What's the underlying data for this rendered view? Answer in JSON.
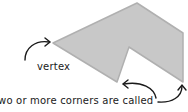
{
  "diagram": {
    "polygon": {
      "points": "53,43 137,3 183,33 183,82 129,47 117,82",
      "fill": "#c8c8c8",
      "stroke": "#b0b0b0"
    },
    "labels": {
      "vertex": "vertex",
      "caption": "wo or more corners are called"
    },
    "arrow_color": "#1a1a1a"
  }
}
